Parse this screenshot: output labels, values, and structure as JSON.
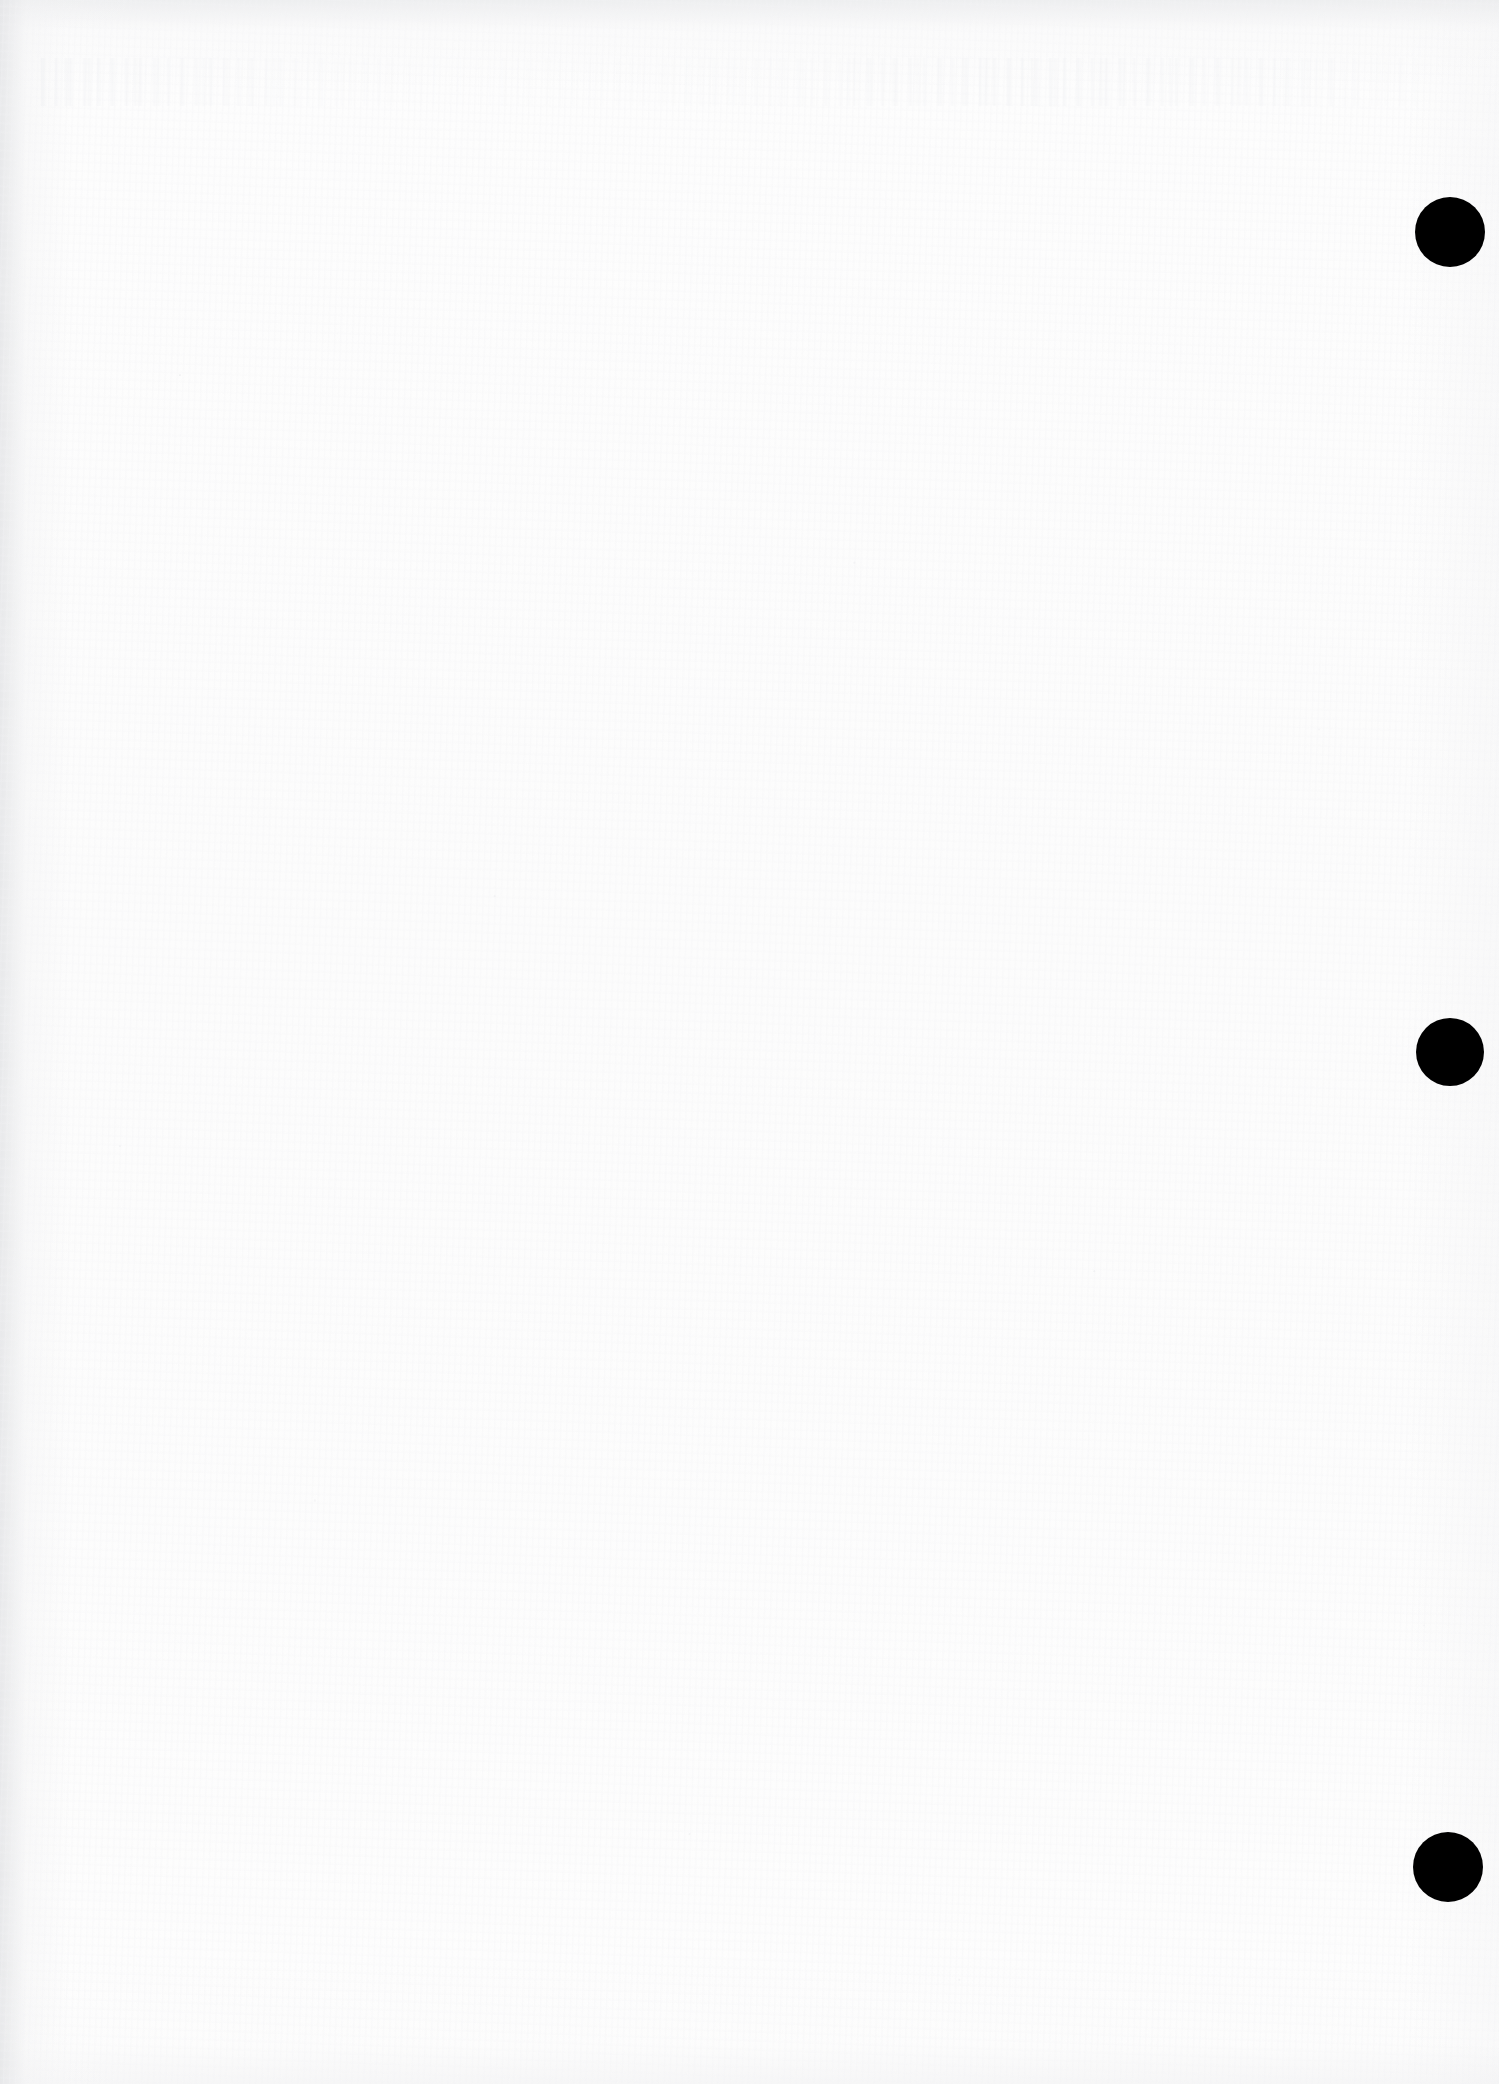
{
  "page": {
    "kind": "scanned-blank-page",
    "width": 1499,
    "height": 2084,
    "paper_color": "#fdfdfd",
    "background_color": "#ffffff",
    "visible_text": "",
    "note": ""
  },
  "artifacts": {
    "ghost_text_band": {
      "name": "bleed-through-ghost-text",
      "legible": false,
      "text": "",
      "x": 40,
      "y": 58,
      "width": 1380,
      "height": 48
    },
    "edge_shading": {
      "left_edge_color": "#e4e5e7",
      "top_edge_color": "#e7e8ea",
      "bottom_edge_color": "#f0f0f1"
    }
  },
  "marks": {
    "color": "#000000",
    "shape": "circle",
    "items": [
      {
        "label": "1",
        "cx": 1450,
        "cy": 232,
        "diameter": 70
      },
      {
        "label": "2",
        "cx": 1450,
        "cy": 1052,
        "diameter": 68
      },
      {
        "label": "3",
        "cx": 1448,
        "cy": 1867,
        "diameter": 70
      }
    ]
  }
}
